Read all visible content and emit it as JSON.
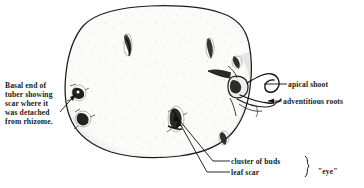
{
  "figure": {
    "kind": "botanical-line-drawing",
    "width": 364,
    "height": 188,
    "background_color": "#ffffff",
    "ink_color": "#1a1a1a",
    "fill_color": "#fbfbfa"
  },
  "labels": {
    "basal_end": "Basal end of\ntuber showing\nscar where it\nwas detached\nfrom rhizome.",
    "apical_shoot": "apical shoot",
    "adventitious_roots": "adventitious roots",
    "cluster_of_buds": "cluster of buds",
    "leaf_scar": "leaf scar",
    "eye": "\"eye\""
  },
  "parts": [
    {
      "name": "tuber-body",
      "description": "rounded potato tuber outline"
    },
    {
      "name": "basal-scar",
      "description": "dark scar at basal end where tuber detached from rhizome"
    },
    {
      "name": "apical-shoot",
      "description": "looping sprout emerging at apical end"
    },
    {
      "name": "adventitious-roots",
      "description": "thin roots emerging below the apical shoot"
    },
    {
      "name": "cluster-of-buds",
      "description": "dark cluster of buds forming an eye"
    },
    {
      "name": "leaf-scar",
      "description": "crescent leaf scar beside the bud cluster"
    }
  ],
  "eye_marks": [
    {
      "name": "eye-upper-left",
      "cx": 128,
      "cy": 44
    },
    {
      "name": "eye-upper-right",
      "cx": 210,
      "cy": 48
    },
    {
      "name": "eye-right-upper",
      "cx": 237,
      "cy": 62
    },
    {
      "name": "eye-lower-center",
      "cx": 177,
      "cy": 120
    },
    {
      "name": "eye-lower-right",
      "cx": 224,
      "cy": 137
    },
    {
      "name": "eye-basal-upper",
      "cx": 79,
      "cy": 93
    },
    {
      "name": "eye-basal-lower",
      "cx": 84,
      "cy": 119
    }
  ]
}
